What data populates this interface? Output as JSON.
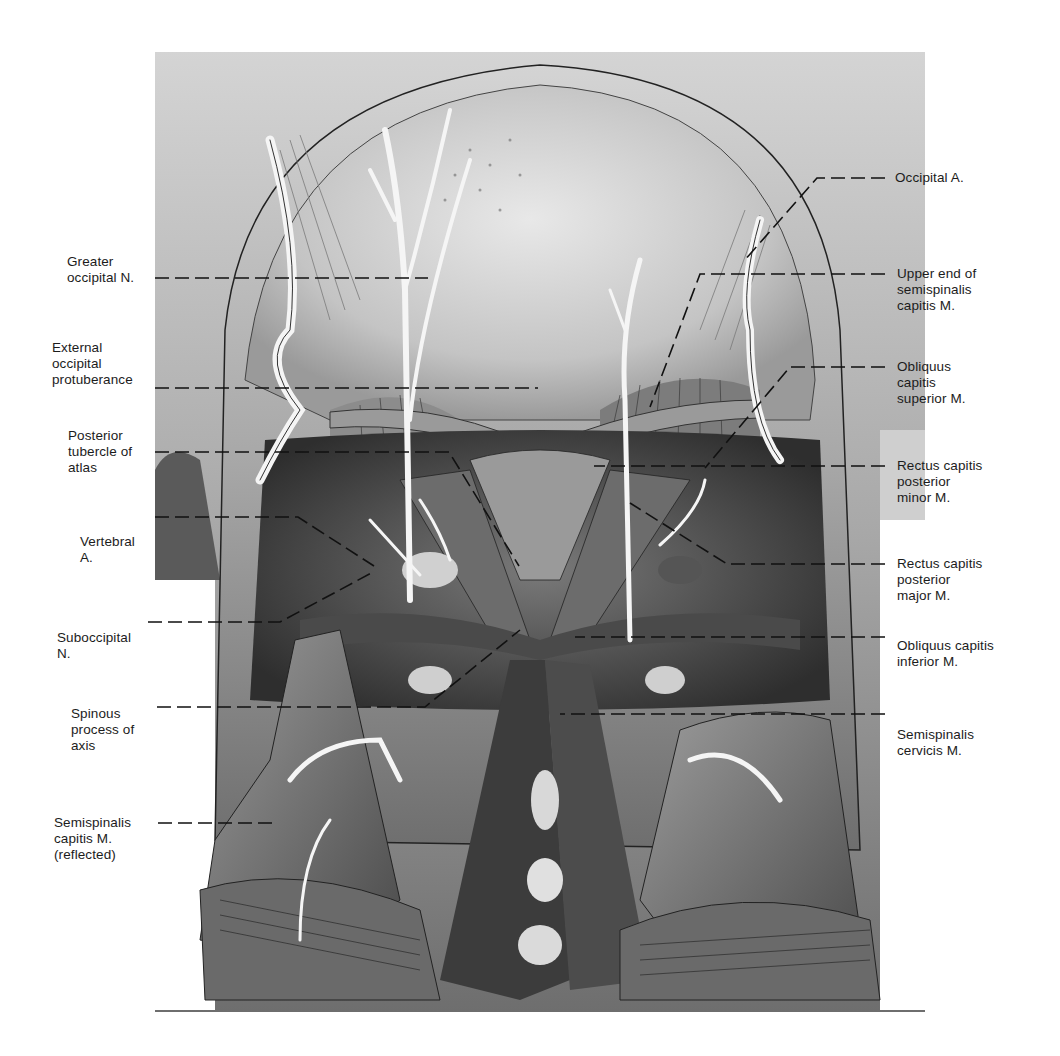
{
  "figure": {
    "type": "anatomical-illustration",
    "colors": {
      "background": "#ffffff",
      "label_text": "#1c1c1c",
      "tissue_dark": "#3a3a3a",
      "tissue_mid": "#8a8a8a",
      "tissue_light": "#d6d6d6",
      "vessel": "#f2f2f2"
    },
    "labels_left": [
      {
        "id": "greater-occipital-n",
        "text": "Greater\noccipital N."
      },
      {
        "id": "external-occipital-protuberance",
        "text": "External\noccipital\nprotuberance"
      },
      {
        "id": "posterior-tubercle-of-atlas",
        "text": "Posterior\ntubercle of\natlas"
      },
      {
        "id": "vertebral-a",
        "text": "Vertebral\nA."
      },
      {
        "id": "suboccipital-n",
        "text": "Suboccipital\nN."
      },
      {
        "id": "spinous-process-of-axis",
        "text": "Spinous\nprocess of\naxis"
      },
      {
        "id": "semispinalis-capitis-reflected",
        "text": "Semispinalis\ncapitis M.\n(reflected)"
      }
    ],
    "labels_right": [
      {
        "id": "occipital-a",
        "text": "Occipital A."
      },
      {
        "id": "upper-end-semispinalis-capitis",
        "text": "Upper end of\nsemispinalis\ncapitis M."
      },
      {
        "id": "obliquus-capitis-superior",
        "text": "Obliquus\ncapitis\nsuperior M."
      },
      {
        "id": "rectus-capitis-posterior-minor",
        "text": "Rectus capitis\nposterior\nminor M."
      },
      {
        "id": "rectus-capitis-posterior-major",
        "text": "Rectus capitis\nposterior\nmajor M."
      },
      {
        "id": "obliquus-capitis-inferior",
        "text": "Obliquus capitis\ninferior M."
      },
      {
        "id": "semispinalis-cervicis",
        "text": "Semispinalis\ncervicis M."
      }
    ],
    "caption": ""
  }
}
